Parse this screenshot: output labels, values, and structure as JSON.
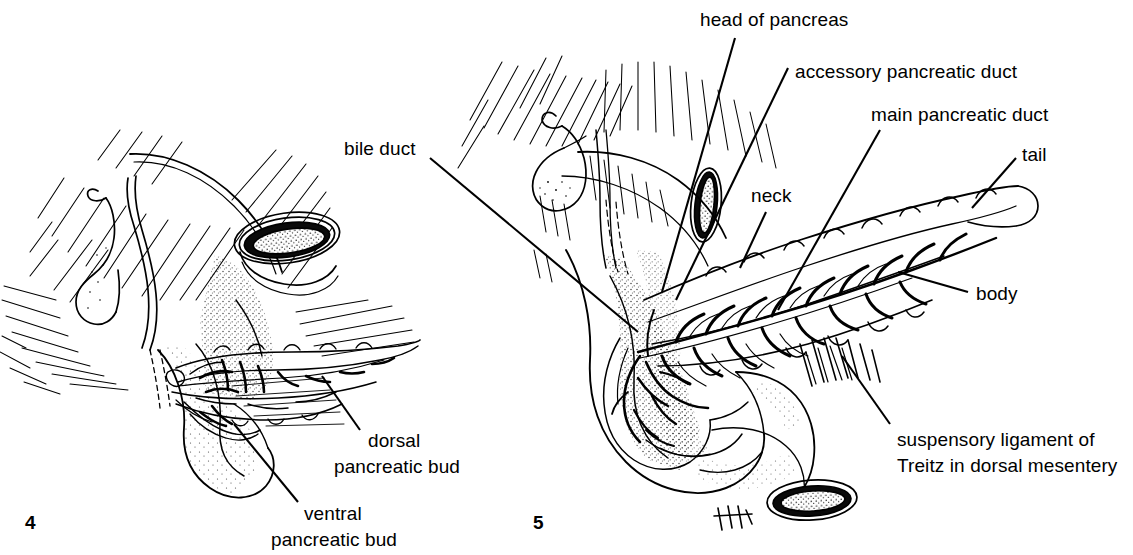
{
  "figure": {
    "background_color": "#ffffff",
    "ink_color": "#000000",
    "width": 1133,
    "height": 555
  },
  "panels": [
    {
      "id": "panel-4",
      "number": "4",
      "caption": "Embryonic pancreas with dorsal and ventral pancreatic buds",
      "labels": [
        {
          "id": "bile-duct",
          "text": "bile duct"
        },
        {
          "id": "dorsal-bud-line1",
          "text": "dorsal"
        },
        {
          "id": "dorsal-bud-line2",
          "text": "pancreatic bud"
        },
        {
          "id": "ventral-bud-line1",
          "text": "ventral"
        },
        {
          "id": "ventral-bud-line2",
          "text": "pancreatic bud"
        }
      ]
    },
    {
      "id": "panel-5",
      "number": "5",
      "caption": "Mature pancreas with head, neck, body, tail and duct system",
      "labels": [
        {
          "id": "head-of-pancreas",
          "text": "head of pancreas"
        },
        {
          "id": "accessory-pancreatic-duct",
          "text": "accessory pancreatic duct"
        },
        {
          "id": "main-pancreatic-duct",
          "text": "main pancreatic duct"
        },
        {
          "id": "tail",
          "text": "tail"
        },
        {
          "id": "neck",
          "text": "neck"
        },
        {
          "id": "body",
          "text": "body"
        },
        {
          "id": "suspensory-ligament-line1",
          "text": "suspensory ligament of"
        },
        {
          "id": "suspensory-ligament-line2",
          "text": "Treitz in dorsal mesentery"
        }
      ]
    }
  ],
  "labels_flat": {
    "bile_duct": "bile duct",
    "dorsal_bud_line1": "dorsal",
    "dorsal_bud_line2": "pancreatic bud",
    "ventral_bud_line1": "ventral",
    "ventral_bud_line2": "pancreatic bud",
    "head_of_pancreas": "head of pancreas",
    "accessory_pancreatic_duct": "accessory pancreatic duct",
    "main_pancreatic_duct": "main pancreatic duct",
    "tail": "tail",
    "neck": "neck",
    "body": "body",
    "suspensory_ligament_line1": "suspensory ligament of",
    "suspensory_ligament_line2": "Treitz in dorsal mesentery",
    "figure_number_left": "4",
    "figure_number_right": "5"
  }
}
